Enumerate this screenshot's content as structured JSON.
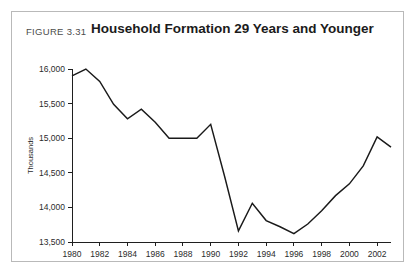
{
  "figure": {
    "number_label": "FIGURE 3.31",
    "title": "Household Formation 29 Years and Younger"
  },
  "chart_data": {
    "type": "line",
    "title": "Household Formation 29 Years and Younger",
    "xlabel": "",
    "ylabel": "Thousands",
    "xlim": [
      1980,
      2003
    ],
    "ylim": [
      13500,
      16000
    ],
    "grid": false,
    "legend": "none",
    "x_tick_labels": [
      "1980",
      "1982",
      "1984",
      "1986",
      "1988",
      "1990",
      "1992",
      "1994",
      "1996",
      "1998",
      "2000",
      "2002"
    ],
    "x_tick_values": [
      1980,
      1982,
      1984,
      1986,
      1988,
      1990,
      1992,
      1994,
      1996,
      1998,
      2000,
      2002
    ],
    "y_tick_labels": [
      "13,500",
      "14,000",
      "14,500",
      "15,000",
      "15,500",
      "16,000"
    ],
    "y_tick_values": [
      13500,
      14000,
      14500,
      15000,
      15500,
      16000
    ],
    "series": [
      {
        "name": "Household Formation 29 Years and Younger",
        "color": "#1a1a1a",
        "x": [
          1980,
          1981,
          1982,
          1983,
          1984,
          1985,
          1986,
          1987,
          1988,
          1989,
          1990,
          1991,
          1992,
          1993,
          1994,
          1995,
          1996,
          1997,
          1998,
          1999,
          2000,
          2001,
          2002,
          2003
        ],
        "values": [
          15900,
          16000,
          15820,
          15490,
          15280,
          15420,
          15230,
          15000,
          15000,
          15000,
          15200,
          14450,
          13660,
          14060,
          13810,
          13720,
          13620,
          13760,
          13950,
          14170,
          14340,
          14600,
          15020,
          14870
        ]
      }
    ]
  }
}
